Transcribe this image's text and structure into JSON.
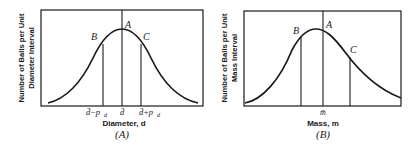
{
  "figure": {
    "panels": [
      {
        "id": "A",
        "caption": "(A)",
        "ylabel_line1": "Number of Balls per Unit",
        "ylabel_line2": "Diameter Interval",
        "xlabel": "Diameter, d",
        "ticks": {
          "left": "d̄−p",
          "left_sub": "d",
          "center": "d̄",
          "right": "d̄+p",
          "right_sub": "d"
        },
        "points": {
          "A": "A",
          "B": "B",
          "C": "C"
        },
        "shape": "symmetric bell curve"
      },
      {
        "id": "B",
        "caption": "(B)",
        "ylabel_line1": "Number of Balls per Unit",
        "ylabel_line2": "Mass Interval",
        "xlabel": "Mass, m",
        "ticks": {
          "center": "m̄"
        },
        "points": {
          "A": "A",
          "B": "B",
          "C": "C"
        },
        "shape": "right-skewed bell curve"
      }
    ]
  }
}
